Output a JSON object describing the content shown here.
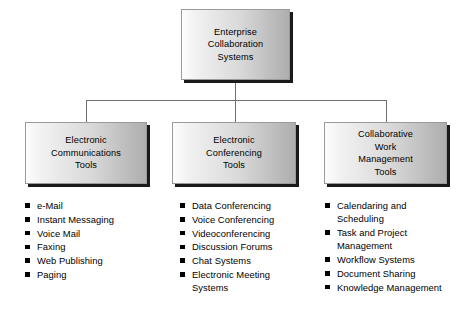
{
  "diagram": {
    "title": "Enterprise Collaboration Systems",
    "root": {
      "label": "Enterprise\nCollaboration\nSystems"
    },
    "branches": [
      {
        "id": "electronic-communications-tools",
        "label": "Electronic\nCommunications\nTools",
        "items": [
          "e-Mail",
          "Instant Messaging",
          "Voice Mail",
          "Faxing",
          "Web Publishing",
          "Paging"
        ]
      },
      {
        "id": "electronic-conferencing-tools",
        "label": "Electronic\nConferencing\nTools",
        "items": [
          "Data Conferencing",
          "Voice Conferencing",
          "Videoconferencing",
          "Discussion Forums",
          "Chat Systems",
          "Electronic Meeting\nSystems"
        ]
      },
      {
        "id": "collaborative-work-management-tools",
        "label": "Collaborative\nWork\nManagement\nTools",
        "items": [
          "Calendaring and\nScheduling",
          "Task and Project\nManagement",
          "Workflow Systems",
          "Document Sharing",
          "Knowledge Management"
        ]
      }
    ],
    "colors": {
      "box_border": "#9a9a9a",
      "box_shadow": "#1a1a1a",
      "connector": "#6f6f6f",
      "text": "#000000",
      "bullet": "#000000",
      "background": "#ffffff"
    }
  }
}
